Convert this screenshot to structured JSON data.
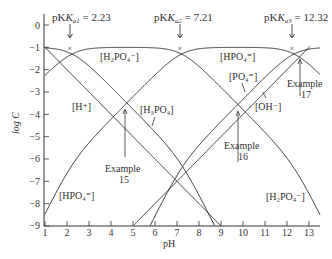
{
  "chart_data": {
    "type": "line",
    "title": "",
    "xlabel": "pH",
    "ylabel": "log C",
    "xlim": [
      1,
      13.5
    ],
    "ylim": [
      -9,
      0.5
    ],
    "x_ticks": [
      "1",
      "2",
      "3",
      "4",
      "5",
      "6",
      "7",
      "8",
      "9",
      "10",
      "11",
      "12",
      "13"
    ],
    "y_ticks": [
      "0",
      "−1",
      "−2",
      "−3",
      "−4",
      "−5",
      "−6",
      "−7",
      "−8",
      "−9"
    ],
    "grid": false,
    "total_log_conc": -1,
    "pKa": [
      2.23,
      7.21,
      12.32
    ],
    "pKw": 14,
    "series": [
      {
        "name": "[H+]",
        "formula": "log C = -pH"
      },
      {
        "name": "[OH−]",
        "formula": "log C = pH - 14"
      },
      {
        "name": "[H3PO4]",
        "species_index": 0
      },
      {
        "name": "[H2PO4−]",
        "species_index": 1
      },
      {
        "name": "[HPO4=]",
        "species_index": 2
      },
      {
        "name": "[PO4≡]",
        "species_index": 3
      }
    ],
    "annotations": [
      {
        "text": "pKa1 = 2.23",
        "x": 2.23,
        "marker": "×",
        "y": -1.3
      },
      {
        "text": "pKa2 = 7.21",
        "x": 7.21,
        "marker": "×",
        "y": -1.3
      },
      {
        "text": "pKa3 = 12.32",
        "x": 12.32,
        "marker": "×",
        "y": -1.3
      },
      {
        "text": "Example 15",
        "pointer_x": 4.6,
        "pointer_y": -3.6
      },
      {
        "text": "Example 16",
        "pointer_x": 9.8,
        "pointer_y": -3.7
      },
      {
        "text": "Example 17",
        "pointer_x": 12.7,
        "pointer_y": -1.6
      }
    ]
  },
  "labels": {
    "pka1_prefix": "pK",
    "pka1_sub": "a1",
    "pka1_value": " = 2.23",
    "pka2_prefix": "pK",
    "pka2_sub": "a2",
    "pka2_value": " = 7.21",
    "pka3_prefix": "pK",
    "pka3_sub": "a3",
    "pka3_value": " = 12.32",
    "h2po4_top": "[H₂PO₄⁻]",
    "hpo4_top": "[HPO₄⁼]",
    "h_plus": "[H⁺]",
    "h3po4": "[H₃PO₄]",
    "po4": "[PO₄⁼]",
    "oh_minus": "[OH⁻]",
    "hpo4_bottom": "[HPO₄⁼]",
    "h2po4_bottom": "[H₂PO₄⁻]",
    "example15_word": "Example",
    "example15_num": "15",
    "example16_word": "Example",
    "example16_num": "16",
    "example17_word": "Example",
    "example17_num": "17",
    "xlabel": "pH",
    "ylabel": "log C"
  }
}
